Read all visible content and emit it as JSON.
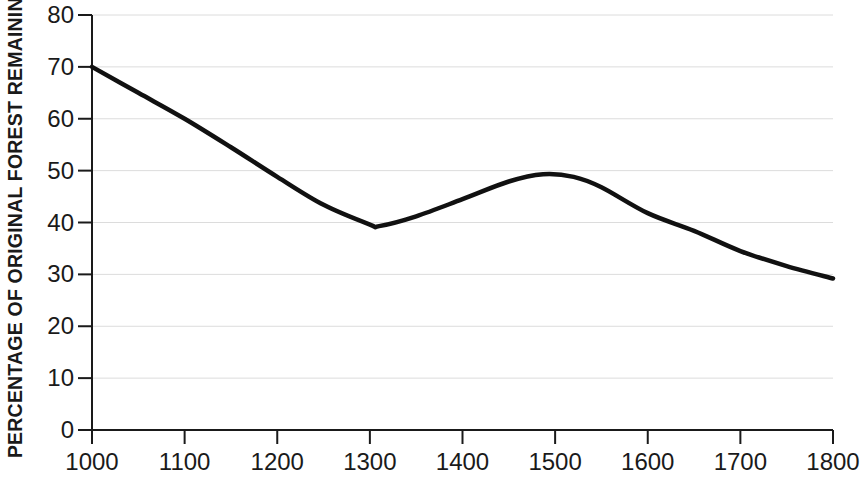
{
  "chart_data": {
    "type": "line",
    "title": "",
    "subtitle": "",
    "xlabel": "",
    "ylabel": "PERCENTAGE OF ORIGINAL FOREST REMAINING",
    "xlim": [
      1000,
      1800
    ],
    "ylim": [
      0,
      80
    ],
    "xticks": [
      1000,
      1100,
      1200,
      1300,
      1400,
      1500,
      1600,
      1700,
      1800
    ],
    "xtick_labels": [
      "1000",
      "1100",
      "1200",
      "1300",
      "1400",
      "1500",
      "1600",
      "1700",
      "1800"
    ],
    "yticks": [
      0,
      10,
      20,
      30,
      40,
      50,
      60,
      70,
      80
    ],
    "ytick_labels": [
      "0",
      "10",
      "20",
      "30",
      "40",
      "50",
      "60",
      "70",
      "80"
    ],
    "grid": true,
    "grid_axis": "y",
    "grid_color": "#dcdcdc",
    "legend": null,
    "line_color": "#111111",
    "line_width": 4.5,
    "x": [
      1000,
      1050,
      1100,
      1150,
      1200,
      1250,
      1300,
      1310,
      1350,
      1400,
      1450,
      1487,
      1520,
      1550,
      1600,
      1650,
      1700,
      1750,
      1800
    ],
    "values": [
      70.0,
      65.0,
      60.0,
      54.5,
      48.8,
      43.4,
      39.6,
      39.3,
      41.2,
      44.5,
      47.9,
      49.3,
      48.8,
      46.8,
      41.8,
      38.4,
      34.5,
      31.6,
      29.2
    ],
    "series": [
      {
        "name": "Percentage of original forest remaining",
        "x": [
          1000,
          1050,
          1100,
          1150,
          1200,
          1250,
          1300,
          1310,
          1350,
          1400,
          1450,
          1487,
          1520,
          1550,
          1600,
          1650,
          1700,
          1750,
          1800
        ],
        "values": [
          70.0,
          65.0,
          60.0,
          54.5,
          48.8,
          43.4,
          39.6,
          39.3,
          41.2,
          44.5,
          47.9,
          49.3,
          48.8,
          46.8,
          41.8,
          38.4,
          34.5,
          31.6,
          29.2
        ]
      }
    ],
    "annotations": [
      {
        "label": "start",
        "x": 1000,
        "y": 70.0
      },
      {
        "label": "minimum",
        "x": 1310,
        "y": 39.3
      },
      {
        "label": "local maximum",
        "x": 1487,
        "y": 49.3
      },
      {
        "label": "end",
        "x": 1800,
        "y": 29.2
      }
    ]
  },
  "axes": {
    "y_axis_title": "PERCENTAGE OF ORIGINAL FOREST REMAINING"
  }
}
